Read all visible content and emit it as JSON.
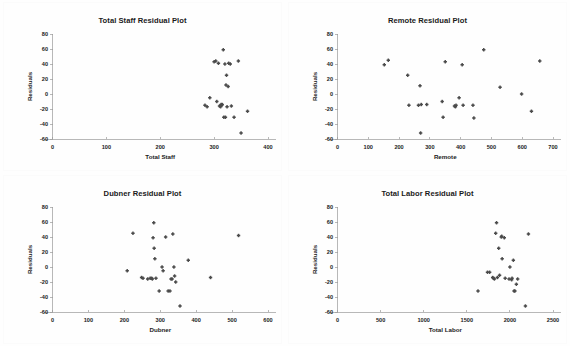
{
  "page": {
    "background": "#fefefe",
    "marker_color": "#4a4a4a",
    "axis_color": "#9a9a9a",
    "text_color": "#1b1b1b"
  },
  "chart_data": [
    {
      "type": "scatter",
      "title": "Total Staff Residual Plot",
      "xlabel": "Total Staff",
      "ylabel": "Residuals",
      "xlim": [
        0,
        400
      ],
      "ylim": [
        -60,
        80
      ],
      "xticks": [
        0,
        100,
        200,
        300,
        400
      ],
      "yticks": [
        -60,
        -40,
        -20,
        0,
        20,
        40,
        60,
        80
      ],
      "grid": false,
      "legend": "none",
      "series": [
        {
          "name": "Residuals",
          "points": [
            [
              283,
              -15
            ],
            [
              287,
              -17
            ],
            [
              292,
              -5
            ],
            [
              300,
              43
            ],
            [
              303,
              44
            ],
            [
              305,
              -10
            ],
            [
              308,
              41
            ],
            [
              310,
              -16
            ],
            [
              312,
              -17
            ],
            [
              313,
              -14
            ],
            [
              314,
              -15
            ],
            [
              315,
              -14
            ],
            [
              317,
              59
            ],
            [
              318,
              -31
            ],
            [
              320,
              40
            ],
            [
              321,
              -31
            ],
            [
              322,
              12
            ],
            [
              323,
              25
            ],
            [
              324,
              -17
            ],
            [
              326,
              10
            ],
            [
              327,
              41
            ],
            [
              330,
              40
            ],
            [
              332,
              -16
            ],
            [
              337,
              -31
            ],
            [
              345,
              44
            ],
            [
              350,
              -52
            ],
            [
              362,
              -23
            ]
          ]
        }
      ]
    },
    {
      "type": "scatter",
      "title": "Remote Residual Plot",
      "xlabel": "Remote",
      "ylabel": "Residuals",
      "xlim": [
        0,
        700
      ],
      "ylim": [
        -60,
        80
      ],
      "xticks": [
        0,
        100,
        200,
        300,
        400,
        500,
        600,
        700
      ],
      "yticks": [
        -60,
        -40,
        -20,
        0,
        20,
        40,
        60,
        80
      ],
      "grid": false,
      "legend": "none",
      "series": [
        {
          "name": "Residuals",
          "points": [
            [
              152,
              39
            ],
            [
              165,
              45
            ],
            [
              228,
              25
            ],
            [
              232,
              -15
            ],
            [
              263,
              -15
            ],
            [
              268,
              11
            ],
            [
              270,
              -52
            ],
            [
              272,
              -14
            ],
            [
              290,
              -14
            ],
            [
              340,
              -10
            ],
            [
              343,
              -31
            ],
            [
              350,
              43
            ],
            [
              380,
              -16
            ],
            [
              383,
              -17
            ],
            [
              385,
              -15
            ],
            [
              395,
              -5
            ],
            [
              405,
              39
            ],
            [
              408,
              -15
            ],
            [
              440,
              -15
            ],
            [
              443,
              -32
            ],
            [
              475,
              59
            ],
            [
              528,
              9
            ],
            [
              598,
              0
            ],
            [
              630,
              -23
            ],
            [
              657,
              44
            ]
          ]
        }
      ]
    },
    {
      "type": "scatter",
      "title": "Dubner Residual Plot",
      "xlabel": "Dubner",
      "ylabel": "Residuals",
      "xlim": [
        0,
        600
      ],
      "ylim": [
        -60,
        80
      ],
      "xticks": [
        0,
        100,
        200,
        300,
        400,
        500,
        600
      ],
      "yticks": [
        -60,
        -40,
        -20,
        0,
        20,
        40,
        60,
        80
      ],
      "grid": false,
      "legend": "none",
      "series": [
        {
          "name": "Residuals",
          "points": [
            [
              208,
              -5
            ],
            [
              224,
              45
            ],
            [
              248,
              -14
            ],
            [
              252,
              -15
            ],
            [
              265,
              -16
            ],
            [
              272,
              -15
            ],
            [
              276,
              -15
            ],
            [
              278,
              -16
            ],
            [
              280,
              39
            ],
            [
              282,
              59
            ],
            [
              283,
              25
            ],
            [
              285,
              11
            ],
            [
              288,
              -15
            ],
            [
              297,
              -32
            ],
            [
              305,
              0
            ],
            [
              308,
              -5
            ],
            [
              315,
              40
            ],
            [
              322,
              -32
            ],
            [
              327,
              -32
            ],
            [
              330,
              -16
            ],
            [
              333,
              -16
            ],
            [
              335,
              44
            ],
            [
              338,
              0
            ],
            [
              340,
              -12
            ],
            [
              343,
              -20
            ],
            [
              355,
              -52
            ],
            [
              378,
              9
            ],
            [
              440,
              -14
            ],
            [
              518,
              42
            ]
          ]
        }
      ]
    },
    {
      "type": "scatter",
      "title": "Total Labor Residual Plot",
      "xlabel": "Total Labor",
      "ylabel": "Residuals",
      "xlim": [
        0,
        2500
      ],
      "ylim": [
        -60,
        80
      ],
      "xticks": [
        0,
        500,
        1000,
        1500,
        2000,
        2500
      ],
      "yticks": [
        -60,
        -40,
        -20,
        0,
        20,
        40,
        60,
        80
      ],
      "grid": false,
      "legend": "none",
      "series": [
        {
          "name": "Residuals",
          "points": [
            [
              1630,
              -32
            ],
            [
              1740,
              -7
            ],
            [
              1765,
              -7
            ],
            [
              1800,
              -14
            ],
            [
              1810,
              -15
            ],
            [
              1820,
              -16
            ],
            [
              1835,
              45
            ],
            [
              1845,
              59
            ],
            [
              1855,
              -14
            ],
            [
              1870,
              25
            ],
            [
              1880,
              -11
            ],
            [
              1900,
              40
            ],
            [
              1905,
              41
            ],
            [
              1910,
              11
            ],
            [
              1935,
              39
            ],
            [
              1945,
              -15
            ],
            [
              1990,
              -16
            ],
            [
              2000,
              0
            ],
            [
              2020,
              -17
            ],
            [
              2025,
              -15
            ],
            [
              2040,
              9
            ],
            [
              2048,
              -32
            ],
            [
              2058,
              -32
            ],
            [
              2075,
              -23
            ],
            [
              2090,
              -16
            ],
            [
              2180,
              -52
            ],
            [
              2215,
              44
            ]
          ]
        }
      ]
    }
  ]
}
